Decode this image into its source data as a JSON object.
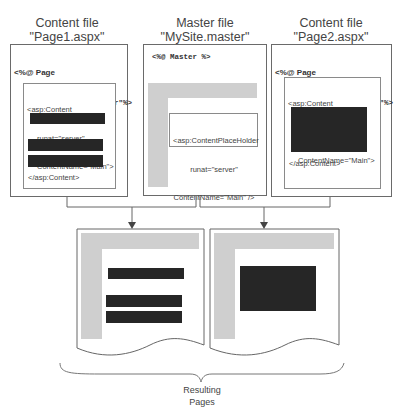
{
  "diagram": {
    "files": [
      {
        "id": "page1",
        "type_label": "Content file",
        "file_name": "\"Page1.aspx\"",
        "directive_line1": "<%@ Page",
        "directive_line2": "Master=\"MySite.master\"%>",
        "content_open_line1": "<asp:Content",
        "content_open_line2": "runat=\"server\"",
        "content_open_line3": "ContentName=\"Main\">",
        "content_close": "</asp:Content>",
        "content_blocks": 3
      },
      {
        "id": "master",
        "type_label": "Master file",
        "file_name": "\"MySite.master\"",
        "directive_line1": "<%@ Master %>",
        "placeholder_line1": "<asp:ContentPlaceHolder",
        "placeholder_line2": "runat=\"server\"",
        "placeholder_line3": "ContentName=\"Main\" />"
      },
      {
        "id": "page2",
        "type_label": "Content file",
        "file_name": "\"Page2.aspx\"",
        "directive_line1": "<%@ Page",
        "directive_line2": "Master=\"MySite.master\"%>",
        "content_open_line1": "<asp:Content",
        "content_open_line2": "runat=\"server\"",
        "content_open_line3": "ContentName=\"Main\">",
        "content_close": "</asp:Content>",
        "content_blocks": 1
      }
    ],
    "result": {
      "label_line1": "Resulting",
      "label_line2": "Pages",
      "pages": [
        {
          "id": "result-page1",
          "source": "Page1.aspx + MySite.master"
        },
        {
          "id": "result-page2",
          "source": "Page2.aspx + MySite.master"
        }
      ]
    },
    "colors": {
      "border": "#6a6a6a",
      "content_block": "#262626",
      "master_chrome": "#cfcfcf",
      "text": "#444444"
    }
  }
}
